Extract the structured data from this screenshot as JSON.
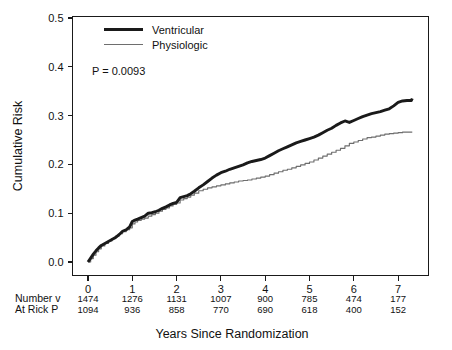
{
  "chart_data": {
    "type": "line",
    "title": "",
    "xlabel": "Years Since Randomization",
    "ylabel": "Cumulative Risk",
    "xlim": [
      -0.12,
      7.7
    ],
    "ylim": [
      0.0,
      0.5
    ],
    "xticks": [
      0,
      1,
      2,
      3,
      4,
      5,
      6,
      7
    ],
    "xticklabels": [
      "0",
      "1",
      "2",
      "3",
      "4",
      "5",
      "6",
      "7"
    ],
    "yticks": [
      0.0,
      0.1,
      0.2,
      0.3,
      0.4,
      0.5
    ],
    "yticklabels": [
      "0.0",
      "0.1",
      "0.2",
      "0.3",
      "0.4",
      "0.5"
    ],
    "grid": false,
    "legend_position": "upper-left-inside",
    "annotations": [
      {
        "name": "p-value",
        "text": "P = 0.0093",
        "x": 0.45,
        "y": 0.405
      }
    ],
    "series": [
      {
        "name": "Ventricular",
        "color": "#1a1a1a",
        "linewidth": 2.9,
        "x": [
          0.0,
          0.06,
          0.12,
          0.18,
          0.24,
          0.3,
          0.38,
          0.46,
          0.54,
          0.62,
          0.7,
          0.78,
          0.86,
          0.94,
          1.0,
          1.06,
          1.12,
          1.2,
          1.28,
          1.36,
          1.44,
          1.52,
          1.6,
          1.68,
          1.76,
          1.84,
          1.92,
          2.0,
          2.08,
          2.16,
          2.24,
          2.32,
          2.4,
          2.5,
          2.6,
          2.7,
          2.8,
          2.9,
          3.0,
          3.1,
          3.2,
          3.3,
          3.4,
          3.5,
          3.6,
          3.7,
          3.8,
          3.9,
          4.0,
          4.1,
          4.2,
          4.3,
          4.4,
          4.5,
          4.6,
          4.7,
          4.8,
          4.9,
          5.0,
          5.1,
          5.2,
          5.3,
          5.4,
          5.5,
          5.6,
          5.7,
          5.8,
          5.9,
          6.0,
          6.1,
          6.2,
          6.3,
          6.4,
          6.5,
          6.6,
          6.7,
          6.8,
          6.9,
          7.0,
          7.1,
          7.2,
          7.3,
          7.32
        ],
        "y": [
          0.0,
          0.008,
          0.016,
          0.023,
          0.029,
          0.034,
          0.038,
          0.042,
          0.046,
          0.05,
          0.056,
          0.063,
          0.066,
          0.072,
          0.083,
          0.086,
          0.088,
          0.091,
          0.094,
          0.1,
          0.101,
          0.103,
          0.106,
          0.11,
          0.113,
          0.117,
          0.12,
          0.122,
          0.132,
          0.134,
          0.136,
          0.14,
          0.145,
          0.152,
          0.158,
          0.165,
          0.172,
          0.178,
          0.183,
          0.186,
          0.19,
          0.193,
          0.196,
          0.199,
          0.203,
          0.206,
          0.208,
          0.21,
          0.213,
          0.218,
          0.223,
          0.228,
          0.232,
          0.236,
          0.24,
          0.244,
          0.247,
          0.25,
          0.253,
          0.256,
          0.26,
          0.265,
          0.27,
          0.274,
          0.28,
          0.285,
          0.289,
          0.286,
          0.29,
          0.294,
          0.298,
          0.301,
          0.304,
          0.306,
          0.308,
          0.311,
          0.314,
          0.32,
          0.327,
          0.33,
          0.331,
          0.331,
          0.335
        ]
      },
      {
        "name": "Physiologic",
        "color": "#6e6e6e",
        "linewidth": 1.15,
        "x": [
          0.0,
          0.06,
          0.12,
          0.18,
          0.24,
          0.3,
          0.38,
          0.46,
          0.54,
          0.62,
          0.7,
          0.78,
          0.86,
          0.94,
          1.0,
          1.06,
          1.12,
          1.2,
          1.28,
          1.36,
          1.44,
          1.52,
          1.6,
          1.68,
          1.76,
          1.84,
          1.92,
          2.0,
          2.08,
          2.16,
          2.24,
          2.32,
          2.4,
          2.5,
          2.6,
          2.7,
          2.8,
          2.9,
          3.0,
          3.1,
          3.2,
          3.3,
          3.4,
          3.5,
          3.6,
          3.7,
          3.8,
          3.9,
          4.0,
          4.1,
          4.2,
          4.3,
          4.4,
          4.5,
          4.6,
          4.7,
          4.8,
          4.9,
          5.0,
          5.1,
          5.2,
          5.3,
          5.4,
          5.5,
          5.6,
          5.7,
          5.8,
          5.9,
          6.0,
          6.1,
          6.2,
          6.3,
          6.4,
          6.5,
          6.6,
          6.7,
          6.8,
          6.9,
          7.0,
          7.1,
          7.2,
          7.3,
          7.32
        ],
        "y": [
          0.0,
          0.007,
          0.014,
          0.021,
          0.027,
          0.033,
          0.038,
          0.043,
          0.048,
          0.053,
          0.058,
          0.062,
          0.066,
          0.07,
          0.078,
          0.082,
          0.085,
          0.088,
          0.09,
          0.094,
          0.097,
          0.1,
          0.104,
          0.108,
          0.111,
          0.115,
          0.118,
          0.121,
          0.127,
          0.13,
          0.133,
          0.137,
          0.141,
          0.146,
          0.149,
          0.152,
          0.154,
          0.156,
          0.158,
          0.16,
          0.162,
          0.164,
          0.166,
          0.167,
          0.168,
          0.17,
          0.172,
          0.174,
          0.176,
          0.179,
          0.182,
          0.185,
          0.188,
          0.19,
          0.193,
          0.196,
          0.199,
          0.202,
          0.205,
          0.209,
          0.213,
          0.217,
          0.221,
          0.225,
          0.229,
          0.233,
          0.238,
          0.243,
          0.246,
          0.249,
          0.252,
          0.255,
          0.256,
          0.258,
          0.26,
          0.262,
          0.263,
          0.264,
          0.265,
          0.266,
          0.266,
          0.266,
          0.266
        ]
      }
    ]
  },
  "legend": {
    "items": [
      {
        "label": "Ventricular",
        "style": "thick-black"
      },
      {
        "label": "Physiologic",
        "style": "thin-gray"
      }
    ]
  },
  "pvalue": {
    "text": "P = 0.0093"
  },
  "axes": {
    "y_title": "Cumulative Risk",
    "x_title": "Years Since Randomization",
    "y_ticks": [
      "0.0",
      "0.1",
      "0.2",
      "0.3",
      "0.4",
      "0.5"
    ],
    "x_ticks": [
      "0",
      "1",
      "2",
      "3",
      "4",
      "5",
      "6",
      "7"
    ]
  },
  "risk_table": {
    "row_label_line1": "Number v",
    "row_label_line2": "At Rick P",
    "rows": [
      {
        "label": "Number v",
        "values": [
          "1474",
          "1276",
          "1131",
          "1007",
          "900",
          "785",
          "474",
          "177"
        ]
      },
      {
        "label": "At Rick P",
        "values": [
          "1094",
          "936",
          "858",
          "770",
          "690",
          "618",
          "400",
          "152"
        ]
      }
    ]
  },
  "colors": {
    "ventricular": "#1a1a1a",
    "physiologic": "#6e6e6e",
    "axis": "#1a1a1a",
    "background": "#ffffff"
  }
}
